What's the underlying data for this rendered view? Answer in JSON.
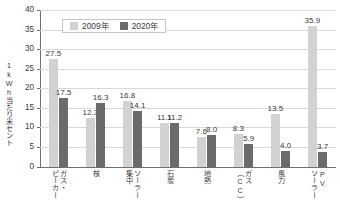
{
  "chart_data": {
    "type": "bar",
    "title": "",
    "xlabel": "",
    "ylabel": "1kWh当たり米セント",
    "ylim": [
      0,
      40
    ],
    "ytick_step": 5,
    "yticks": [
      "0",
      "5",
      "10",
      "15",
      "20",
      "25",
      "30",
      "35",
      "40"
    ],
    "grid": true,
    "legend_position": "top-left-inside",
    "categories": [
      "ガス・ピーカー",
      "核",
      "ソーラー集中",
      "石炭",
      "地熱",
      "ガス（CC）",
      "風力",
      "PVソーラー"
    ],
    "category_columns": [
      [
        "ガス・",
        "ピーカー"
      ],
      [
        "核"
      ],
      [
        "ソーラー",
        "集中"
      ],
      [
        "石炭"
      ],
      [
        "地熱"
      ],
      [
        "ガス",
        "（CC）"
      ],
      [
        "風力"
      ],
      [
        "PV",
        "ソーラー"
      ]
    ],
    "series": [
      {
        "name": "2009年",
        "color": "#d2d2d2",
        "values": [
          27.5,
          12.3,
          16.8,
          11.1,
          7.6,
          8.3,
          13.5,
          35.9
        ],
        "labels": [
          "27.5",
          "12.3",
          "16.8",
          "11.1",
          "7.6",
          "8.3",
          "13.5",
          "35.9"
        ]
      },
      {
        "name": "2020年",
        "color": "#6b6b6b",
        "values": [
          17.5,
          16.3,
          14.1,
          11.2,
          8.0,
          5.9,
          4.0,
          3.7
        ],
        "labels": [
          "17.5",
          "16.3",
          "14.1",
          "11.2",
          "8.0",
          "5.9",
          "4.0",
          "3.7"
        ]
      }
    ]
  }
}
